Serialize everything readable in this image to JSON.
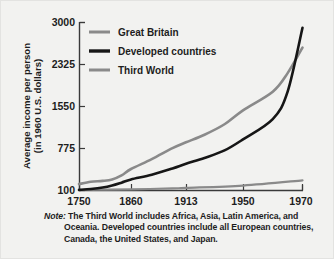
{
  "chart_data": {
    "type": "line",
    "title": "",
    "xlabel": "",
    "ylabel": "Average income per person (in 1960 U.S. dollars)",
    "ylabel_line1": "Average income per person",
    "ylabel_line2": "(in 1960 U.S. dollars)",
    "x_ticks": [
      "1750",
      "1860",
      "1913",
      "1950",
      "1970"
    ],
    "x_tick_values": [
      1750,
      1860,
      1913,
      1950,
      1970
    ],
    "y_ticks": [
      "100",
      "775",
      "1550",
      "2325",
      "3000"
    ],
    "y_tick_values": [
      100,
      775,
      1550,
      2325,
      3000
    ],
    "ylim": [
      100,
      3000
    ],
    "xlim": [
      1750,
      1970
    ],
    "grid": false,
    "legend_position": "top-left-inside",
    "series": [
      {
        "name": "Great Britain",
        "color": "#8a8a8a",
        "x": [
          1750,
          1775,
          1800,
          1820,
          1840,
          1860,
          1880,
          1900,
          1913,
          1925,
          1938,
          1950,
          1960,
          1965,
          1970
        ],
        "values": [
          210,
          250,
          265,
          290,
          360,
          470,
          640,
          830,
          930,
          1060,
          1240,
          1480,
          1800,
          2120,
          2560
        ]
      },
      {
        "name": "Developed countries",
        "color": "#161616",
        "x": [
          1750,
          1775,
          1800,
          1820,
          1840,
          1860,
          1880,
          1900,
          1913,
          1925,
          1938,
          1950,
          1960,
          1965,
          1970
        ],
        "values": [
          110,
          125,
          150,
          185,
          235,
          290,
          370,
          480,
          560,
          660,
          790,
          980,
          1330,
          1800,
          2900
        ]
      },
      {
        "name": "Third World",
        "color": "#8a8a8a",
        "x": [
          1750,
          1800,
          1860,
          1900,
          1913,
          1950,
          1970
        ],
        "values": [
          110,
          115,
          120,
          135,
          145,
          185,
          275
        ]
      }
    ],
    "legend": [
      {
        "label": "Great Britain",
        "color": "#8a8a8a"
      },
      {
        "label": "Developed countries",
        "color": "#161616"
      },
      {
        "label": "Third World",
        "color": "#8a8a8a"
      }
    ],
    "note": {
      "label": "Note:",
      "text": "The Third World includes Africa, Asia, Latin America, and Oceania. Developed countries include all European countries, Canada, the United States, and Japan."
    }
  },
  "colors": {
    "background": "#f2f2f0",
    "axis": "#3a3a3a",
    "text": "#1d1d1d",
    "great_britain": "#8a8a8a",
    "developed": "#161616",
    "third_world": "#8a8a8a"
  }
}
